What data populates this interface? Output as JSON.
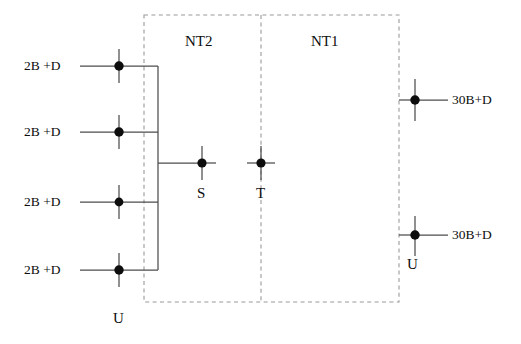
{
  "diagram": {
    "colors": {
      "line": "#4d4d4d",
      "node": "#0d0d0d",
      "dashed": "#9a9a9a",
      "text": "#0d0d0d",
      "background": "#ffffff"
    },
    "zones": [
      {
        "id": "nt2",
        "label": "NT2",
        "x": 185,
        "y": 34
      },
      {
        "id": "nt1",
        "label": "NT1",
        "x": 311,
        "y": 34
      }
    ],
    "inputs": [
      {
        "id": "input-1",
        "label": "2B +D",
        "x": 24,
        "y": 59,
        "node_x": 119,
        "node_y": 66
      },
      {
        "id": "input-2",
        "label": "2B +D",
        "x": 24,
        "y": 125,
        "node_x": 119,
        "node_y": 132
      },
      {
        "id": "input-3",
        "label": "2B +D",
        "x": 24,
        "y": 195,
        "node_x": 119,
        "node_y": 202
      },
      {
        "id": "input-4",
        "label": "2B +D",
        "x": 24,
        "y": 263,
        "node_x": 119,
        "node_y": 270
      }
    ],
    "outputs": [
      {
        "id": "output-1",
        "label": "30B+D",
        "x": 452,
        "y": 93,
        "node_x": 415,
        "node_y": 100
      },
      {
        "id": "output-2",
        "label": "30B+D",
        "x": 452,
        "y": 228,
        "node_x": 415,
        "node_y": 235
      }
    ],
    "reference_points": [
      {
        "id": "point-s",
        "label": "S",
        "x": 197,
        "y": 186,
        "node_x": 202,
        "node_y": 163
      },
      {
        "id": "point-t",
        "label": "T",
        "x": 256,
        "y": 186,
        "node_x": 261,
        "node_y": 163
      },
      {
        "id": "point-u-left",
        "label": "U",
        "x": 113,
        "y": 311,
        "node_x": 119,
        "node_y": 270
      },
      {
        "id": "point-u-right",
        "label": "U",
        "x": 407,
        "y": 257,
        "node_x": 415,
        "node_y": 235
      }
    ],
    "geometry": {
      "box_left": 144,
      "box_top": 15,
      "box_right": 399,
      "box_bottom": 302,
      "divider_x": 261,
      "bus_x": 158,
      "bus_top": 66,
      "bus_bottom": 270,
      "node_radius": 4.6,
      "stub_half_height": 17,
      "input_line_start": 80,
      "output_line_end": 448
    }
  }
}
